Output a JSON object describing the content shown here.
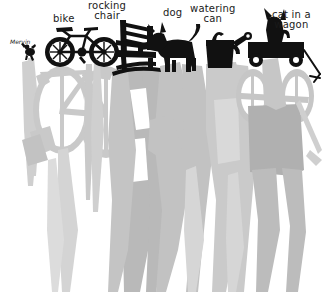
{
  "scene": {
    "title": "silhouettes-with-shadows",
    "width": 324,
    "height": 294,
    "background_color": "#ffffff",
    "silhouette_color": "#111111",
    "shadow_color_light": "#d8d8d8",
    "shadow_color_mid": "#bdbdbd",
    "shadow_color_dark": "#a9a9a9"
  },
  "labels": [
    {
      "text": "Mervin",
      "x": 10,
      "y": 38,
      "size": "tiny"
    },
    {
      "text": "bike",
      "x": 53,
      "y": 14,
      "size": "normal"
    },
    {
      "text": "rocking\nchair",
      "x": 92,
      "y": 1,
      "size": "normal"
    },
    {
      "text": "dog",
      "x": 163,
      "y": 8,
      "size": "normal"
    },
    {
      "text": "watering\ncan",
      "x": 192,
      "y": 4,
      "size": "normal"
    },
    {
      "text": "cat in a\nwagon",
      "x": 275,
      "y": 10,
      "size": "normal"
    }
  ],
  "objects": [
    {
      "name": "mervin-bug",
      "label": "Mervin"
    },
    {
      "name": "bike",
      "label": "bike"
    },
    {
      "name": "rocking-chair",
      "label": "rocking chair"
    },
    {
      "name": "dog",
      "label": "dog"
    },
    {
      "name": "watering-can",
      "label": "watering can"
    },
    {
      "name": "cat-in-a-wagon",
      "label": "cat in a wagon"
    }
  ]
}
